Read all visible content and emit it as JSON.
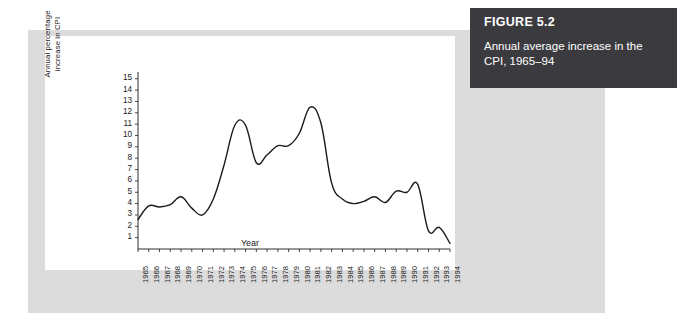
{
  "figure": {
    "number_label": "FIGURE 5.2",
    "caption": "Annual average increase in the CPI, 1965–94"
  },
  "colors": {
    "caption_box_bg": "#3b3b3f",
    "caption_text": "#ffffff",
    "panel_bg": "#dcdcdc",
    "plot_bg": "#ffffff",
    "line": "#1a1a1a",
    "axis": "#1a1a1a"
  },
  "chart_data": {
    "type": "line",
    "title": "",
    "xlabel": "Year",
    "ylabel": "Annual percentage increase in CPI",
    "ylabel_line1": "Annual percentage",
    "ylabel_line2": "increase in CPI",
    "grid": false,
    "legend": false,
    "xlim": [
      1965,
      1994
    ],
    "ylim": [
      0,
      15.5
    ],
    "ytick_labels": [
      "15",
      "14",
      "13",
      "12",
      "11",
      "10",
      "9",
      "8",
      "7",
      "6",
      "5",
      "4",
      "3",
      "2",
      "1"
    ],
    "yticks": [
      15,
      14,
      13,
      12,
      11,
      10,
      9,
      8,
      7,
      6,
      5,
      4,
      3,
      2,
      1
    ],
    "categories": [
      "1965",
      "1966",
      "1967",
      "1968",
      "1969",
      "1970",
      "1971",
      "1972",
      "1973",
      "1974",
      "1975",
      "1976",
      "1977",
      "1978",
      "1979",
      "1980",
      "1981",
      "1982",
      "1983",
      "1984",
      "1985",
      "1986",
      "1987",
      "1988",
      "1989",
      "1990",
      "1991",
      "1992",
      "1993",
      "1994"
    ],
    "x": [
      1965,
      1966,
      1967,
      1968,
      1969,
      1970,
      1971,
      1972,
      1973,
      1974,
      1975,
      1976,
      1977,
      1978,
      1979,
      1980,
      1981,
      1982,
      1983,
      1984,
      1985,
      1986,
      1987,
      1988,
      1989,
      1990,
      1991,
      1992,
      1993,
      1994
    ],
    "values": [
      2.6,
      3.8,
      3.7,
      3.9,
      4.6,
      3.6,
      3.0,
      4.4,
      7.4,
      10.9,
      10.9,
      7.6,
      8.3,
      9.1,
      9.1,
      10.2,
      12.5,
      11.1,
      5.8,
      4.4,
      4.0,
      4.2,
      4.6,
      4.1,
      5.1,
      5.0,
      5.7,
      1.6,
      1.9,
      0.5
    ],
    "series": [
      {
        "name": "Annual percentage increase in CPI",
        "values": [
          2.6,
          3.8,
          3.7,
          3.9,
          4.6,
          3.6,
          3.0,
          4.4,
          7.4,
          10.9,
          10.9,
          7.6,
          8.3,
          9.1,
          9.1,
          10.2,
          12.5,
          11.1,
          5.8,
          4.4,
          4.0,
          4.2,
          4.6,
          4.1,
          5.1,
          5.0,
          5.7,
          1.6,
          1.9,
          0.5
        ]
      }
    ],
    "annotations": []
  }
}
